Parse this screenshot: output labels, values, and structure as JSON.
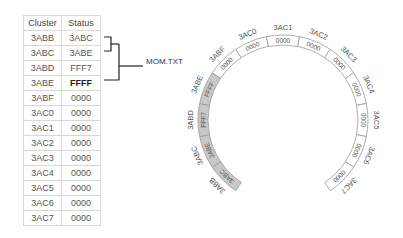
{
  "table": {
    "headers": [
      "Cluster",
      "Status"
    ],
    "rows": [
      {
        "cluster": "3ABB",
        "status": "3ABC",
        "bold": false
      },
      {
        "cluster": "3ABC",
        "status": "3ABE",
        "bold": false
      },
      {
        "cluster": "3ABD",
        "status": "FFF7",
        "bold": false
      },
      {
        "cluster": "3ABE",
        "status": "FFFF",
        "bold": true
      },
      {
        "cluster": "3ABF",
        "status": "0000",
        "bold": false
      },
      {
        "cluster": "3AC0",
        "status": "0000",
        "bold": false
      },
      {
        "cluster": "3AC1",
        "status": "0000",
        "bold": false
      },
      {
        "cluster": "3AC2",
        "status": "0000",
        "bold": false
      },
      {
        "cluster": "3AC3",
        "status": "0000",
        "bold": false
      },
      {
        "cluster": "3AC4",
        "status": "0000",
        "bold": false
      },
      {
        "cluster": "3AC5",
        "status": "0000",
        "bold": false
      },
      {
        "cluster": "3AC6",
        "status": "0000",
        "bold": false
      },
      {
        "cluster": "3AC7",
        "status": "0000",
        "bold": false
      }
    ]
  },
  "file_label": "MOM.TXT",
  "ring": {
    "center": [
      283,
      120
    ],
    "outer_radius": 85,
    "inner_radius": 75,
    "segment_degrees": 22.5,
    "shaded_color": "#c8c8c8",
    "stroke_color": "#999999",
    "segments": [
      {
        "cluster": "3ABB",
        "value": "3ABC",
        "shaded": true
      },
      {
        "cluster": "3ABC",
        "value": "3ABE",
        "shaded": true
      },
      {
        "cluster": "3ABD",
        "value": "FFF7",
        "shaded": true
      },
      {
        "cluster": "3ABE",
        "value": "FFFF",
        "shaded": true
      },
      {
        "cluster": "3ABF",
        "value": "0000",
        "shaded": false
      },
      {
        "cluster": "3AC0",
        "value": "0000",
        "shaded": false
      },
      {
        "cluster": "3AC1",
        "value": "0000",
        "shaded": false
      },
      {
        "cluster": "3AC2",
        "value": "0000",
        "shaded": false
      },
      {
        "cluster": "3AC3",
        "value": "0000",
        "shaded": false
      },
      {
        "cluster": "3AC4",
        "value": "0000",
        "shaded": false
      },
      {
        "cluster": "3AC5",
        "value": "0000",
        "shaded": false
      },
      {
        "cluster": "3AC6",
        "value": "0000",
        "shaded": false
      },
      {
        "cluster": "3AC7",
        "value": "0000",
        "shaded": false
      }
    ]
  }
}
